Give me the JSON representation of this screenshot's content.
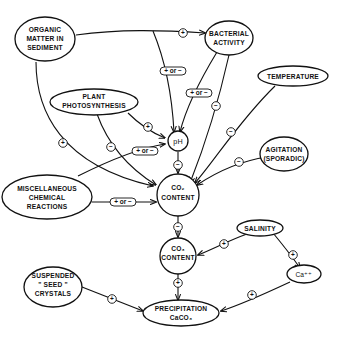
{
  "diagram": {
    "type": "causal-loop",
    "nodes": {
      "organic_matter": {
        "lines": [
          "ORGANIC",
          "MATTER IN",
          "SEDIMENT"
        ]
      },
      "bacterial_activity": {
        "lines": [
          "BACTERIAL",
          "ACTIVITY"
        ]
      },
      "temperature": {
        "lines": [
          "TEMPERATURE"
        ]
      },
      "plant_photosynthesis": {
        "lines": [
          "PLANT",
          "PHOTOSYNTHESIS"
        ]
      },
      "ph": {
        "lines": [
          "pH"
        ]
      },
      "agitation": {
        "lines": [
          "AGITATION",
          "(SPORADIC)"
        ]
      },
      "misc_reactions": {
        "lines": [
          "MISCELLANEOUS",
          "CHEMICAL",
          "REACTIONS"
        ]
      },
      "co2_content": {
        "lines": [
          "CO₂",
          "CONTENT"
        ]
      },
      "salinity": {
        "lines": [
          "SALINITY"
        ]
      },
      "co3_content": {
        "lines": [
          "CO₃",
          "CONTENT"
        ]
      },
      "ca": {
        "lines": [
          "Ca⁺⁺"
        ]
      },
      "seed_crystals": {
        "lines": [
          "SUSPENDED",
          "\" SEED \"",
          "CRYSTALS"
        ]
      },
      "precipitation": {
        "lines": [
          "PRECIPITATION",
          "CaCO₃"
        ]
      }
    },
    "edges": [
      {
        "from": "organic_matter",
        "to": "bacterial_activity",
        "sign": "+"
      },
      {
        "from": "organic_matter",
        "to": "ph",
        "sign": "+ or −"
      },
      {
        "from": "organic_matter",
        "to": "co2_content",
        "sign": "+"
      },
      {
        "from": "bacterial_activity",
        "to": "ph",
        "sign": "+ or −"
      },
      {
        "from": "bacterial_activity",
        "to": "co2_content",
        "sign": "−"
      },
      {
        "from": "plant_photosynthesis",
        "to": "ph",
        "sign": "+"
      },
      {
        "from": "plant_photosynthesis",
        "to": "co2_content",
        "sign": "−"
      },
      {
        "from": "temperature",
        "to": "co2_content",
        "sign": "−"
      },
      {
        "from": "agitation",
        "to": "co2_content",
        "sign": "−"
      },
      {
        "from": "ph",
        "to": "co2_content",
        "sign": "−"
      },
      {
        "from": "misc_reactions",
        "to": "ph",
        "sign": "+ or −"
      },
      {
        "from": "misc_reactions",
        "to": "co2_content",
        "sign": "+ or −"
      },
      {
        "from": "co2_content",
        "to": "co3_content",
        "sign": "−"
      },
      {
        "from": "salinity",
        "to": "co3_content",
        "sign": "+"
      },
      {
        "from": "salinity",
        "to": "ca",
        "sign": "+"
      },
      {
        "from": "co3_content",
        "to": "precipitation",
        "sign": "+"
      },
      {
        "from": "ca",
        "to": "precipitation",
        "sign": "+"
      },
      {
        "from": "seed_crystals",
        "to": "precipitation",
        "sign": "+"
      }
    ],
    "signs": {
      "plus": "+",
      "minus": "−",
      "plus_or_minus": "+ or −"
    }
  }
}
